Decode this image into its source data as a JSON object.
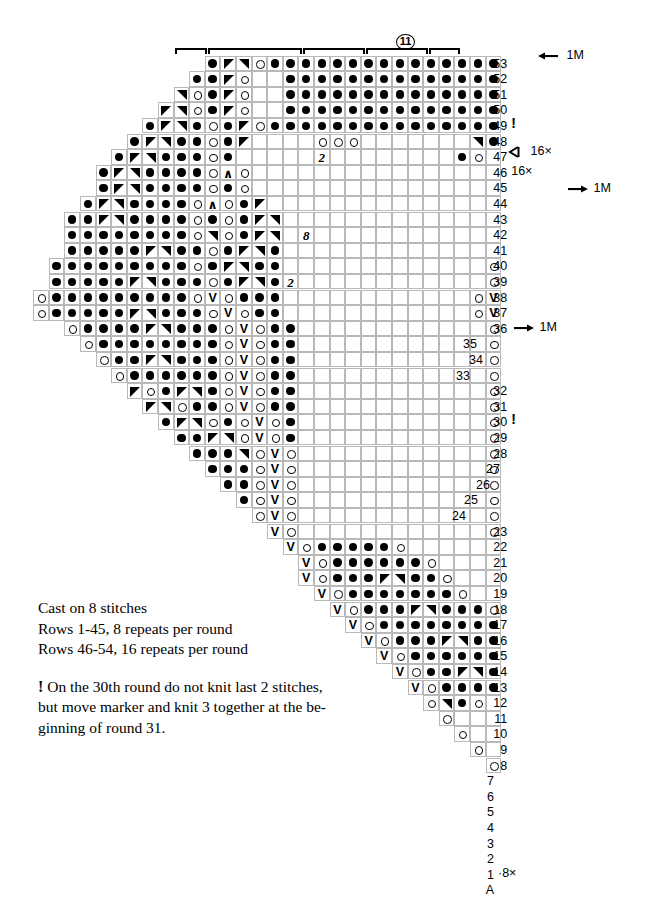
{
  "chart_data": {
    "type": "table",
    "cell_size_px": 15.6,
    "symbols": {
      "dot": "purl / dark stitch (filled circle)",
      "ring": "yarn over (open circle)",
      "dl": "left-leaning decrease (solid triangle)",
      "dr": "right-leaning decrease (solid triangle)",
      "v": "slip stitch (V)",
      "a": "central double decrease (chevron)",
      "num": "repeat count in empty cells"
    },
    "rows": [
      {
        "num": "53",
        "start_col": 11,
        "cells": "d,l,r,o,d,d,d,d,d,d,d,d,d,d,d,d,d,d,d,d,d,d,d,d,d,d,d,d,d,d,o,R"
      },
      {
        "num": "52",
        "start_col": 10,
        "cells": "d,d,l,o,b,b,d,d,d,d,d,d,d,d,d,d,d,d,d,d,d,d,d,d,d,d,d,d,d,o,R,d"
      },
      {
        "num": "51",
        "start_col": 9,
        "cells": "r,o,d,l,o,b,b,d,d,d,d,d,d,d,d,d,d,d,d,d,d,d,d,d,d,d,d,d,o,R,d,o"
      },
      {
        "num": "50",
        "start_col": 8,
        "cells": "l,r,o,d,l,o,b,b,d,d,d,d,d,d,d,d,d,d,d,d,d,d,d,d,d,d,d,o,R,d,o,b"
      },
      {
        "num": "49",
        "start_col": 7,
        "cells": "d,l,r,d,o,d,l,o,d,d,d,d,d,d,d,d,d,d,d,d,d,d,d,d,d,d,o,R,d,o,b,b",
        "note": "!"
      },
      {
        "num": "48",
        "start_col": 6,
        "cells": "d,l,r,d,d,o,d,l,b,b,b,b,o,o,o,b,b,b,b,b,b,b,r,d,o,b,b,b,b,b,b,b"
      },
      {
        "num": "47",
        "start_col": 5,
        "cells": "d,l,r,d,d,d,o,d,b,b,b,b,b,n2,b,b,b,b,b,b,b,b,d,o,b,b,b,b,b,b,b,b"
      },
      {
        "num": "46",
        "start_col": 4,
        "cells": "d,l,r,d,d,d,d,o,A,o,b,b,b,b,b,b,b,b,b,b,b,b,b,b,b,b,b,b,b,b,b,b",
        "note": "16×",
        "arrow": "left"
      },
      {
        "num": "45",
        "start_col": 4,
        "cells": "d,l,r,d,d,d,d,o,d,o,b,b,b,b,b,b,b,b,b,b,b,b,b,b,b,b,b,b,b,b,b,b"
      },
      {
        "num": "44",
        "start_col": 3,
        "cells": "d,l,r,d,d,d,d,o,A,o,d,l,b,b,b,b,b,b,b,b,b,b,b,b,b,b,b,b,b,o,A,b"
      },
      {
        "num": "43",
        "start_col": 2,
        "cells": "d,d,l,r,d,d,d,d,o,d,o,d,l,r,b,b,b,b,b,b,b,b,b,b,b,b,b,b,o,r,d,o",
        "arrow": "right",
        "arrow_label": "1M"
      },
      {
        "num": "42",
        "start_col": 2,
        "cells": "d,d,d,d,d,d,d,d,o,r,o,d,l,r,b,n8,b,b,b,b,b,b,b,b,b,b,b,b,o,r,d,o"
      },
      {
        "num": "41",
        "start_col": 2,
        "cells": "d,d,d,d,d,l,r,d,d,o,d,l,r,d,b,b,b,b,b,b,b,b,b,b,b,b,b,b,o,r,d,o"
      },
      {
        "num": "40",
        "start_col": 1,
        "cells": "d,d,d,d,d,d,d,d,d,o,d,l,r,d,d,b,b,b,b,b,b,b,b,b,b,b,b,b,o,r,d,o"
      },
      {
        "num": "39",
        "start_col": 1,
        "cells": "d,d,d,d,d,l,r,d,d,d,o,d,l,r,d,n2,b,b,b,b,b,b,b,b,b,b,b,b,o,r,d,o"
      },
      {
        "num": "38",
        "start_col": 0,
        "cells": "o,d,d,d,d,d,d,d,d,d,o,V,o,d,d,d,b,b,b,b,b,b,b,b,b,b,b,b,o,V,d,o"
      },
      {
        "num": "37",
        "start_col": 0,
        "cells": "o,d,d,d,d,d,l,r,d,d,d,o,V,o,d,d,b,b,b,b,b,b,b,b,b,b,b,b,o,V,o,b"
      },
      {
        "num": "36",
        "start_col": 2,
        "cells": "o,d,d,d,d,l,r,d,d,d,o,V,o,d,d,b,b,b,b,b,b,b,b,b,b,b,b,o,V,b,b,b"
      },
      {
        "num": "35",
        "start_col": 3,
        "cells": "o,d,d,d,d,d,d,d,d,o,V,o,d,d,b,b,b,b,b,b,b,b,b,b,b,b,o,V,b,b,b,b"
      },
      {
        "num": "34",
        "start_col": 4,
        "cells": "o,d,d,l,r,d,d,d,o,V,o,d,d,b,b,b,b,b,b,b,b,b,b,b,b,o,V,b,b,b,b,b"
      },
      {
        "num": "33",
        "start_col": 5,
        "cells": "o,d,d,d,d,d,d,o,V,o,d,d,b,b,b,b,b,b,b,b,b,b,b,b,o,V,b,b,b,b,b,b"
      },
      {
        "num": "32",
        "start_col": 6,
        "cells": "l,o,d,l,r,d,o,V,o,d,d,b,b,b,b,b,b,b,b,b,b,b,b,o,r,b,b,b,b,b,b,b"
      },
      {
        "num": "31",
        "start_col": 7,
        "cells": "l,r,o,d,d,o,V,o,d,d,b,b,b,b,b,b,b,b,b,b,b,b,o,l,b,b,b,b,b,b,b,b",
        "arrow": "right",
        "arrow_label": "1M"
      },
      {
        "num": "30",
        "start_col": 8,
        "cells": "d,l,r,o,d,o,V,o,d,b,b,b,b,b,b,b,b,b,b,b,b,o,b,b,b,b,b,b,b,b,b,b",
        "note": "!"
      },
      {
        "num": "29",
        "start_col": 9,
        "cells": "d,d,l,r,o,V,o,d,b,b,b,b,b,b,b,b,b,b,b,b,o,b,b,b,b,b,b,b,b,b,b,b"
      },
      {
        "num": "28",
        "start_col": 10,
        "cells": "d,d,d,r,o,V,o,b,b,b,b,b,b,b,b,b,b,b,b,o,b,b,b,b,b,b,b,b,b,b,b,b"
      },
      {
        "num": "27",
        "start_col": 11,
        "cells": "d,d,d,o,V,o,b,b,b,b,b,b,b,b,b,b,b,b,o,b,b,b,b,b,b,b,b,b,b,b,b,b"
      },
      {
        "num": "26",
        "start_col": 12,
        "cells": "d,d,o,V,o,b,b,b,b,b,b,b,b,b,b,b,b,o,b,b,b,b,b,b,b,b,b,b,b,b,b,b"
      },
      {
        "num": "25",
        "start_col": 13,
        "cells": "d,o,V,o,b,b,b,b,b,b,b,b,b,b,b,b,o,b,b,b,b,b,b,b,b,b,b,b,b,b,b,b"
      },
      {
        "num": "24",
        "start_col": 14,
        "cells": "o,V,o,b,b,b,b,b,b,b,b,b,b,b,b,o,b,b,b,b,b,b,b,b,b,b,b,b,b,b,b,b"
      },
      {
        "num": "23",
        "start_col": 15,
        "cells": "V,o,b,b,b,b,b,b,b,b,b,b,b,b,o,b,b,b,b,b,b,b,b,b,b,b,b,b,b,b,b,b"
      },
      {
        "num": "22",
        "start_col": 16,
        "cells": "V,o,d,d,d,d,d,o,b,b,b,b,b,b,b,b,b,b,b,b,b,b,b,b,b,b,b,b,b,b,b,b"
      },
      {
        "num": "21",
        "start_col": 17,
        "cells": "V,o,d,d,d,d,d,d,o,b,b,b,b,b,b,b,b,b,b,b,b,b,b,b,b,b,b,b,b,b,b,b"
      },
      {
        "num": "20",
        "start_col": 17,
        "cells": "V,o,d,d,d,l,r,d,d,o,b,b,b,b,b,b,b,b,b,b,b,b,b,b,b,b,b,b,b,b,b,b"
      },
      {
        "num": "19",
        "start_col": 18,
        "cells": "V,o,d,d,d,d,d,d,d,o,b,b,b,b,b,b,b,b,b,b,b,b,b,b,b,b,b,b,b,b,b,b"
      },
      {
        "num": "18",
        "start_col": 19,
        "cells": "V,o,d,d,d,l,r,d,d,d,o,b,b,b,b,b,b,b,b,b,b,b,b,b,b,b,b,b,b,b,b,b"
      },
      {
        "num": "17",
        "start_col": 20,
        "cells": "V,o,d,d,d,d,d,d,d,d,o,b,b,b,b,b,b,b,b,b,b,b,b,b,b,b,b,b,b,b,b,b"
      },
      {
        "num": "16",
        "start_col": 21,
        "cells": "V,o,d,d,d,l,r,d,d,d,d,o,b,b,b,b,b,b,b,b,b,b,b,b,b,b,b,b,b,b,b,b"
      },
      {
        "num": "15",
        "start_col": 22,
        "cells": "V,o,d,d,d,d,d,d,d,d,d,o,b,b,b,b,b,b,b,b,b,b,b,b,b,b,b,b,b,b,b,b"
      },
      {
        "num": "14",
        "start_col": 23,
        "cells": "V,o,d,d,l,r,d,o,r,b,b,b,b,b,b,b,b,b,b,b,b,b,b,b,b,b,b,b,b,b,b,b"
      },
      {
        "num": "13",
        "start_col": 24,
        "cells": "V,o,d,d,d,d,o,r,l,b,b,b,b,b,b,b,b,b,b,b,b,b,b,b,b,b,b,b,b,b,b,b"
      },
      {
        "num": "12",
        "start_col": 25,
        "cells": "o,r,d,o,b,d,l,r,d,b,b,b,b,b,b,b,b,b,b,b,b,b,b,b,b,b,b,b,b,b,b,b"
      },
      {
        "num": "11",
        "start_col": 26,
        "cells": "o,b,b,b,d,d,l,r,d,d,b,b,b,b,b,b,b,b,b,b,b,b,b,b,b,b,b,b,b,b,b,b"
      },
      {
        "num": "10",
        "start_col": 27,
        "cells": "o,b,b,d,d,d,l,r,d,d,d,b,b,b,b,b,b,b,b,b,b,b,b,b,b,b,b,b,b,b,b,b"
      },
      {
        "num": "9",
        "start_col": 28,
        "cells": "o,b,d,d,d,d,l,r,d,d,d,d,o,b,b,b,b,b,b,b,b,b,b,b,b,b,b,b,b,b,b,b"
      },
      {
        "num": "8",
        "start_col": 29,
        "cells": "o,d,d,d,d,d,d,d,d,d,d,o,b,b,b,b,b,b,b,b,b,b,b,b,b,b,b,b,b,b,b,b"
      },
      {
        "num": "7",
        "start_col": 30,
        "cells": "o,d,d,d,l,r,d,d,d,d,o,b,b,b,b,b,b,b,b,b,b,b,b,b,b,b,b,b,b,b,b,b"
      },
      {
        "num": "6",
        "start_col": 31,
        "cells": "o,d,d,d,d,d,d,d,d,o,b,b,b,b,b,b,b,b,b,b,b,b,b,b,b,b,b,b,b,b,b,b"
      },
      {
        "num": "5",
        "start_col": 32,
        "cells": "o,d,d,d,d,d,d,d,o,b,b,b,b,b,b,b,b,b,b,b,b,b,b,b,b,b,b,b,b,b,b,b"
      },
      {
        "num": "4",
        "start_col": 33,
        "cells": "o,r,d,d,d,d,o,b,b,b,b,b,b,b,b,b,b,b,b,b,b,b,b,b,b,b,b,b,b,b,b,b"
      },
      {
        "num": "3",
        "start_col": 34,
        "cells": "o,d,d,d,d,o,b,b,b,b,b,b,b,b,b,b,b,b,b,b,b,b,b,b,b,b,b,b,b,b,b,b"
      },
      {
        "num": "2",
        "start_col": 35,
        "cells": "o,d,d,d,o,b,b,b,b,b,b,b,b,b,b,b,b,b,b,b,b,b,b,b,b,b,b,b,b,b,b,b"
      },
      {
        "num": "1",
        "start_col": 36,
        "cells": "o,d,d,o,b,b,b,b,b,b,b,b,b,b,b,b,b,b,b,b,b,b,b,b,b,b,b,b,b,b,b,b",
        "note": "·8×"
      },
      {
        "num": "A",
        "start_col": 37,
        "cells": "d,b,b,b,b,b,b,b,b,b,b,b,b,b,b,b,b,b,b,b,b,b,b,b,b,b,b,b,b,b,b,b"
      }
    ]
  },
  "top": {
    "circled_number": "11",
    "brackets": 5
  },
  "annotations": [
    {
      "id": "ann-1m-top",
      "label": "1M",
      "arrow": "left"
    },
    {
      "id": "ann-16x",
      "label": "16×",
      "arrow": "left-open"
    },
    {
      "id": "ann-1m-43",
      "label": "1M",
      "arrow": "right"
    },
    {
      "id": "ann-1m-31",
      "label": "1M",
      "arrow": "right"
    }
  ],
  "legend": {
    "line1": "Cast on 8 stitches",
    "line2": "Rows 1-45, 8 repeats per round",
    "line3": "Rows 46-54, 16 repeats per round",
    "note_mark": "!",
    "note_line1": "On the 30th round do not knit last 2 stitches,",
    "note_line2": "but move marker and knit 3 together at the be-",
    "note_line3": "ginning of round 31."
  },
  "row_marks": {
    "bang_49": "!",
    "bang_30": "!",
    "x16": "16×",
    "x8": "·8×",
    "count_8": "8",
    "count_2": "2"
  }
}
